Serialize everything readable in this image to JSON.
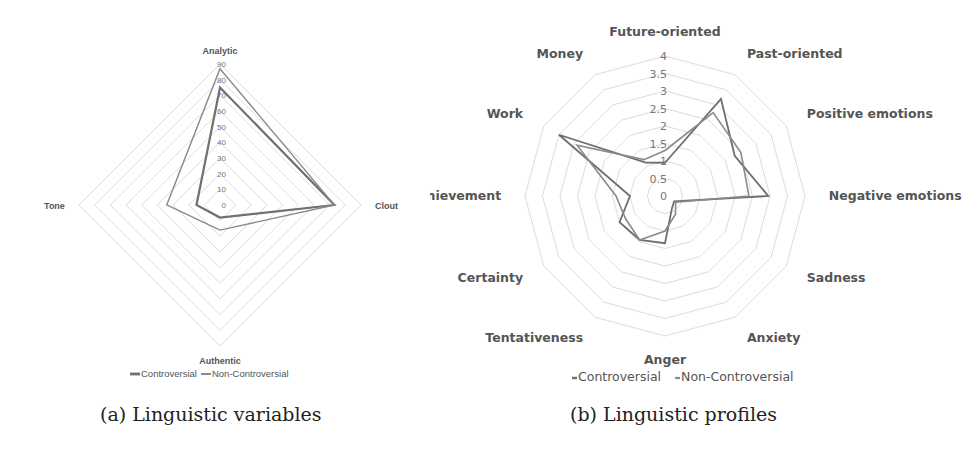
{
  "chart_data": [
    {
      "id": "a",
      "type": "radar",
      "caption": "(a) Linguistic variables",
      "title": "",
      "axes": [
        "Analytic",
        "Clout",
        "Authentic",
        "Tone"
      ],
      "rlim": [
        0,
        90
      ],
      "ticks": [
        0,
        10,
        20,
        30,
        40,
        50,
        60,
        70,
        80,
        90
      ],
      "grid": true,
      "legend_position": "bottom",
      "series": [
        {
          "name": "Controversial",
          "values": [
            75,
            73,
            8,
            15
          ],
          "color": "#707070",
          "width": 2.2
        },
        {
          "name": "Non-Controversial",
          "values": [
            87,
            73,
            16,
            34
          ],
          "color": "#8a8a8a",
          "width": 1.4
        }
      ]
    },
    {
      "id": "b",
      "type": "radar",
      "caption": "(b) Linguistic profiles",
      "title": "",
      "axes": [
        "Future-oriented",
        "Past-oriented",
        "Positive emotions",
        "Negative emotions",
        "Sadness",
        "Anxiety",
        "Anger",
        "Tentativeness",
        "Certainty",
        "Achievement",
        "Work",
        "Money"
      ],
      "rlim": [
        0,
        4
      ],
      "ticks": [
        0,
        0.5,
        1,
        1.5,
        2,
        2.5,
        3,
        3.5,
        4
      ],
      "grid": true,
      "legend_position": "bottom",
      "series": [
        {
          "name": "Controversial",
          "values": [
            0.95,
            3.2,
            2.3,
            2.95,
            0.3,
            0.4,
            1.35,
            1.45,
            1.5,
            1.0,
            3.5,
            1.1
          ],
          "color": "#6e6e6e",
          "width": 1.8
        },
        {
          "name": "Non-Controversial",
          "values": [
            1.3,
            2.75,
            2.5,
            2.4,
            0.35,
            0.6,
            1.0,
            1.45,
            1.3,
            1.4,
            2.9,
            1.2
          ],
          "color": "#8a8a8a",
          "width": 1.6
        }
      ]
    }
  ],
  "captions": {
    "a": "(a) Linguistic variables",
    "b": "(b) Linguistic profiles"
  }
}
